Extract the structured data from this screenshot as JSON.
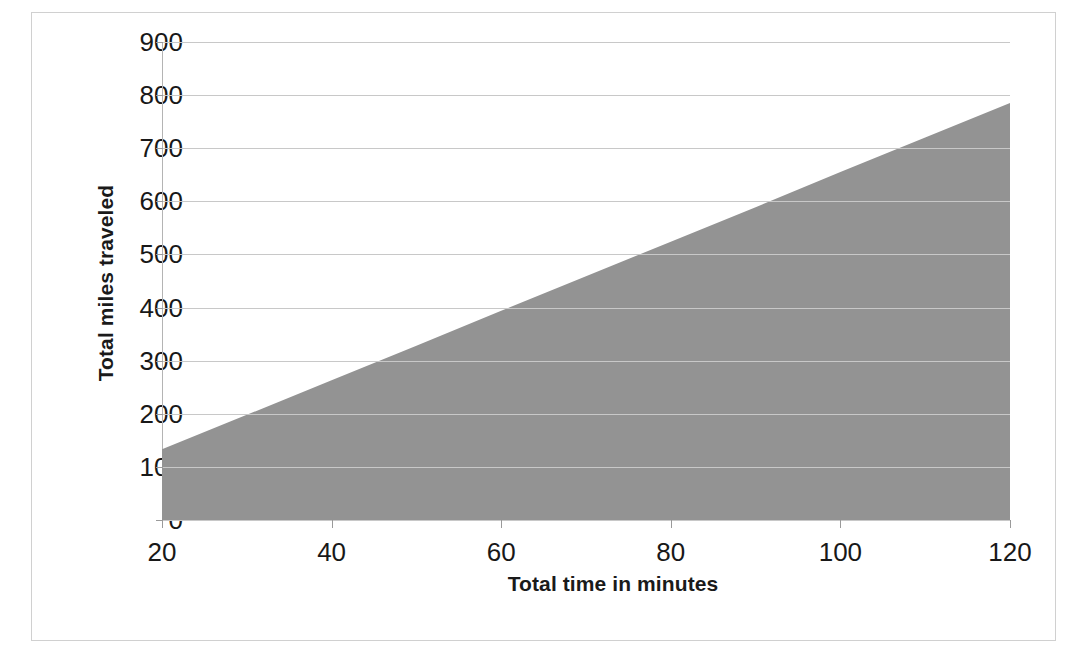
{
  "chart_data": {
    "type": "area",
    "title": "",
    "xlabel": "Total time in minutes",
    "ylabel": "Total miles traveled",
    "x": [
      20,
      30,
      40,
      50,
      60,
      70,
      80,
      90,
      100,
      110,
      120
    ],
    "values": [
      133,
      198,
      263,
      328,
      394,
      459,
      524,
      589,
      655,
      720,
      785
    ],
    "series": [
      {
        "name": "Total miles traveled",
        "values": [
          133,
          198,
          263,
          328,
          394,
          459,
          524,
          589,
          655,
          720,
          785
        ]
      }
    ],
    "xlim": [
      20,
      120
    ],
    "ylim": [
      0,
      900
    ],
    "xticks": [
      "20",
      "40",
      "60",
      "80",
      "100",
      "120"
    ],
    "yticks": [
      "0",
      "100",
      "200",
      "300",
      "400",
      "500",
      "600",
      "700",
      "800",
      "900"
    ],
    "grid": true,
    "legend": "none",
    "fill_color": "#939393",
    "gridline_color": "#c8c8c8",
    "axis_color": "#b4b4b4",
    "text_color": "#181818",
    "slope_miles_per_minute": 6.52
  },
  "axes": {
    "y_title": "Total miles traveled",
    "x_title": "Total time in minutes",
    "y_ticks": [
      {
        "label": "900",
        "value": 900
      },
      {
        "label": "800",
        "value": 800
      },
      {
        "label": "700",
        "value": 700
      },
      {
        "label": "600",
        "value": 600
      },
      {
        "label": "500",
        "value": 500
      },
      {
        "label": "400",
        "value": 400
      },
      {
        "label": "300",
        "value": 300
      },
      {
        "label": "200",
        "value": 200
      },
      {
        "label": "100",
        "value": 100
      },
      {
        "label": "0",
        "value": 0
      }
    ],
    "x_ticks": [
      {
        "label": "20",
        "value": 20
      },
      {
        "label": "40",
        "value": 40
      },
      {
        "label": "60",
        "value": 60
      },
      {
        "label": "80",
        "value": 80
      },
      {
        "label": "100",
        "value": 100
      },
      {
        "label": "120",
        "value": 120
      }
    ]
  }
}
